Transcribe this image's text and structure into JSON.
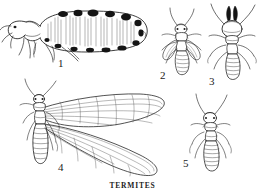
{
  "plate": {
    "caption": "TERMITES",
    "background_color": "#ffffff",
    "ink_color": "#1a1a1a",
    "medium": "pen-and-ink line engraving",
    "subject": "termites (Isoptera) caste plate",
    "width": 265,
    "height": 194
  },
  "figures": [
    {
      "number": "1",
      "label": "1",
      "name": "queen-termite",
      "caste": "queen",
      "view": "lateral",
      "description": "physogastric queen in side view with greatly swollen abdomen bearing dark segmental blotches",
      "label_x": 58,
      "label_y": 58
    },
    {
      "number": "2",
      "label": "2",
      "name": "nymph-termite",
      "caste": "nymph with wing pads",
      "view": "dorsal",
      "description": "young winged form with short wing pads and long antennae",
      "label_x": 160,
      "label_y": 70
    },
    {
      "number": "3",
      "label": "3",
      "name": "soldier-termite",
      "caste": "soldier",
      "view": "dorsal",
      "description": "soldier with enlarged rounded head and prominent dark curved mandibles",
      "label_x": 209,
      "label_y": 76
    },
    {
      "number": "4",
      "label": "4",
      "name": "alate-termite",
      "caste": "alate reproductive",
      "view": "dorsal",
      "description": "winged reproductive with two pairs of long veined wings spread to the right",
      "label_x": 58,
      "label_y": 162
    },
    {
      "number": "5",
      "label": "5",
      "name": "worker-termite",
      "caste": "worker",
      "view": "dorsal",
      "description": "wingless worker with segmented abdomen and long antennae",
      "label_x": 183,
      "label_y": 158
    }
  ]
}
